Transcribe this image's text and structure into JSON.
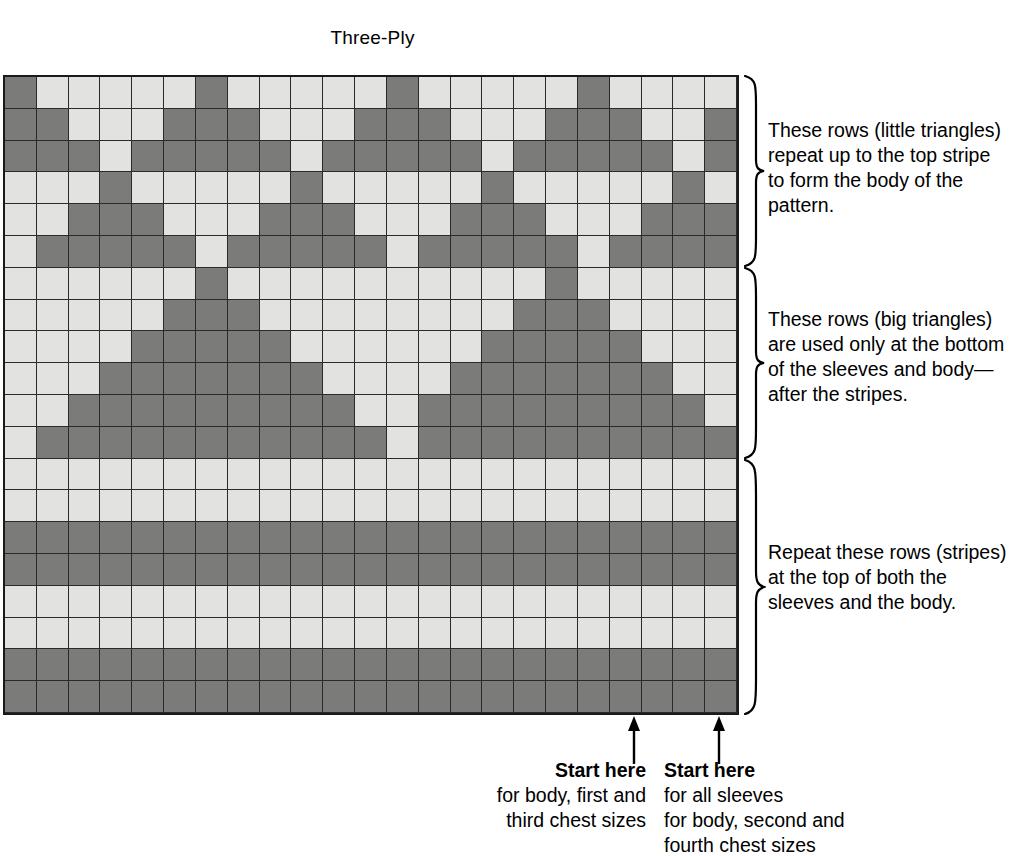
{
  "chart": {
    "title": "Three-Ply",
    "type": "knitting-colorwork-chart",
    "columns": 23,
    "rows": 20,
    "colors": {
      "light": "#e2e3e1",
      "dark": "#7b7c7a",
      "grid_line": "#1a1a1a"
    },
    "legend": {
      "light_meaning": "light yarn stitch",
      "dark_meaning": "dark yarn stitch"
    }
  },
  "chart_data": {
    "type": "heatmap",
    "title": "Three-Ply",
    "xlabel": "",
    "ylabel": "",
    "columns": 23,
    "rows": 20,
    "value_map": {
      "L": "light",
      "D": "dark"
    },
    "grid": [
      [
        "D",
        "L",
        "L",
        "L",
        "L",
        "L",
        "D",
        "L",
        "L",
        "L",
        "L",
        "L",
        "D",
        "L",
        "L",
        "L",
        "L",
        "L",
        "D",
        "L",
        "L",
        "L",
        "L"
      ],
      [
        "D",
        "D",
        "L",
        "L",
        "L",
        "D",
        "D",
        "D",
        "L",
        "L",
        "L",
        "D",
        "D",
        "D",
        "L",
        "L",
        "L",
        "D",
        "D",
        "D",
        "L",
        "L",
        "D"
      ],
      [
        "D",
        "D",
        "D",
        "L",
        "D",
        "D",
        "D",
        "D",
        "D",
        "L",
        "D",
        "D",
        "D",
        "D",
        "D",
        "L",
        "D",
        "D",
        "D",
        "D",
        "D",
        "L",
        "D"
      ],
      [
        "L",
        "L",
        "L",
        "D",
        "L",
        "L",
        "L",
        "L",
        "L",
        "D",
        "L",
        "L",
        "L",
        "L",
        "L",
        "D",
        "L",
        "L",
        "L",
        "L",
        "L",
        "D",
        "L"
      ],
      [
        "L",
        "L",
        "D",
        "D",
        "D",
        "L",
        "L",
        "L",
        "D",
        "D",
        "D",
        "L",
        "L",
        "L",
        "D",
        "D",
        "D",
        "L",
        "L",
        "L",
        "D",
        "D",
        "D"
      ],
      [
        "L",
        "D",
        "D",
        "D",
        "D",
        "D",
        "L",
        "D",
        "D",
        "D",
        "D",
        "D",
        "L",
        "D",
        "D",
        "D",
        "D",
        "D",
        "L",
        "D",
        "D",
        "D",
        "D"
      ],
      [
        "L",
        "L",
        "L",
        "L",
        "L",
        "L",
        "D",
        "L",
        "L",
        "L",
        "L",
        "L",
        "L",
        "L",
        "L",
        "L",
        "L",
        "D",
        "L",
        "L",
        "L",
        "L",
        "L"
      ],
      [
        "L",
        "L",
        "L",
        "L",
        "L",
        "D",
        "D",
        "D",
        "L",
        "L",
        "L",
        "L",
        "L",
        "L",
        "L",
        "L",
        "D",
        "D",
        "D",
        "L",
        "L",
        "L",
        "L"
      ],
      [
        "L",
        "L",
        "L",
        "L",
        "D",
        "D",
        "D",
        "D",
        "D",
        "L",
        "L",
        "L",
        "L",
        "L",
        "L",
        "D",
        "D",
        "D",
        "D",
        "D",
        "L",
        "L",
        "L"
      ],
      [
        "L",
        "L",
        "L",
        "D",
        "D",
        "D",
        "D",
        "D",
        "D",
        "D",
        "L",
        "L",
        "L",
        "L",
        "D",
        "D",
        "D",
        "D",
        "D",
        "D",
        "D",
        "L",
        "L"
      ],
      [
        "L",
        "L",
        "D",
        "D",
        "D",
        "D",
        "D",
        "D",
        "D",
        "D",
        "D",
        "L",
        "L",
        "D",
        "D",
        "D",
        "D",
        "D",
        "D",
        "D",
        "D",
        "D",
        "L"
      ],
      [
        "L",
        "D",
        "D",
        "D",
        "D",
        "D",
        "D",
        "D",
        "D",
        "D",
        "D",
        "D",
        "L",
        "D",
        "D",
        "D",
        "D",
        "D",
        "D",
        "D",
        "D",
        "D",
        "D"
      ],
      [
        "L",
        "L",
        "L",
        "L",
        "L",
        "L",
        "L",
        "L",
        "L",
        "L",
        "L",
        "L",
        "L",
        "L",
        "L",
        "L",
        "L",
        "L",
        "L",
        "L",
        "L",
        "L",
        "L"
      ],
      [
        "L",
        "L",
        "L",
        "L",
        "L",
        "L",
        "L",
        "L",
        "L",
        "L",
        "L",
        "L",
        "L",
        "L",
        "L",
        "L",
        "L",
        "L",
        "L",
        "L",
        "L",
        "L",
        "L"
      ],
      [
        "D",
        "D",
        "D",
        "D",
        "D",
        "D",
        "D",
        "D",
        "D",
        "D",
        "D",
        "D",
        "D",
        "D",
        "D",
        "D",
        "D",
        "D",
        "D",
        "D",
        "D",
        "D",
        "D"
      ],
      [
        "D",
        "D",
        "D",
        "D",
        "D",
        "D",
        "D",
        "D",
        "D",
        "D",
        "D",
        "D",
        "D",
        "D",
        "D",
        "D",
        "D",
        "D",
        "D",
        "D",
        "D",
        "D",
        "D"
      ],
      [
        "L",
        "L",
        "L",
        "L",
        "L",
        "L",
        "L",
        "L",
        "L",
        "L",
        "L",
        "L",
        "L",
        "L",
        "L",
        "L",
        "L",
        "L",
        "L",
        "L",
        "L",
        "L",
        "L"
      ],
      [
        "L",
        "L",
        "L",
        "L",
        "L",
        "L",
        "L",
        "L",
        "L",
        "L",
        "L",
        "L",
        "L",
        "L",
        "L",
        "L",
        "L",
        "L",
        "L",
        "L",
        "L",
        "L",
        "L"
      ],
      [
        "D",
        "D",
        "D",
        "D",
        "D",
        "D",
        "D",
        "D",
        "D",
        "D",
        "D",
        "D",
        "D",
        "D",
        "D",
        "D",
        "D",
        "D",
        "D",
        "D",
        "D",
        "D",
        "D"
      ],
      [
        "D",
        "D",
        "D",
        "D",
        "D",
        "D",
        "D",
        "D",
        "D",
        "D",
        "D",
        "D",
        "D",
        "D",
        "D",
        "D",
        "D",
        "D",
        "D",
        "D",
        "D",
        "D",
        "D"
      ]
    ],
    "annotations": [
      {
        "id": "top",
        "rows": "1-6",
        "text": "These rows (little triangles) repeat up to the top stripe to form the body of the pattern."
      },
      {
        "id": "middle",
        "rows": "7-12",
        "text": "These rows (big triangles) are used only at the bottom of the sleeves and body—after the stripes."
      },
      {
        "id": "bottom",
        "rows": "13-20",
        "text": "Repeat these rows (stripes) at the top of both the sleeves and the body."
      }
    ],
    "markers": [
      {
        "id": "start-left",
        "column": 20,
        "label": "Start here for body, first and third chest sizes"
      },
      {
        "id": "start-right",
        "column": 23,
        "label": "Start here for all sleeves for body, second and fourth chest sizes"
      }
    ]
  },
  "annotations": {
    "top": {
      "lines": [
        "These rows (little triangles)",
        "repeat up to the top stripe",
        "to form the body of the",
        "pattern."
      ]
    },
    "middle": {
      "lines": [
        "These rows (big triangles)",
        "are used only at the bottom",
        "of the sleeves and body—",
        "after the stripes."
      ]
    },
    "bottom": {
      "lines": [
        "Repeat these rows (stripes)",
        "at the top of both the",
        "sleeves and the body."
      ]
    }
  },
  "start_markers": {
    "left": {
      "title": "Start here",
      "lines": [
        "for body, first and",
        "third chest sizes"
      ]
    },
    "right": {
      "title": "Start here",
      "lines": [
        "for all sleeves",
        "for body, second and",
        "fourth chest sizes"
      ]
    }
  }
}
